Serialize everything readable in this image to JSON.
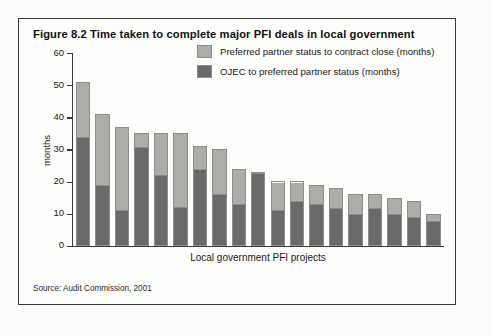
{
  "figure": {
    "title": "Figure 8.2 Time taken to complete major PFI deals in local government",
    "source": "Source: Audit Commission, 2001"
  },
  "legend": {
    "items": [
      {
        "label": "Preferred partner status to contract close (months)",
        "color": "#acaca8",
        "key": "preferred_to_close"
      },
      {
        "label": "OJEC to preferred partner status (months)",
        "color": "#6a6a6a",
        "key": "ojec_to_preferred"
      }
    ]
  },
  "axes": {
    "y_title": "months",
    "x_title": "Local government PFI projects",
    "y_ticks": [
      "0",
      "10",
      "20",
      "30",
      "40",
      "50",
      "60"
    ]
  },
  "chart_data": {
    "type": "bar",
    "title": "Figure 8.2 Time taken to complete major PFI deals in local government",
    "xlabel": "Local government PFI projects",
    "ylabel": "months",
    "ylim": [
      0,
      60
    ],
    "ytick_step": 10,
    "stacked": true,
    "grid": false,
    "legend_position": "top-right-inside",
    "categories": [
      "1",
      "2",
      "3",
      "4",
      "5",
      "6",
      "7",
      "8",
      "9",
      "10",
      "11",
      "12",
      "13",
      "14",
      "15",
      "16",
      "17",
      "18",
      "19"
    ],
    "series": [
      {
        "name": "OJEC to preferred partner status (months)",
        "color": "#6a6a6a",
        "values": [
          34,
          19,
          11,
          31,
          22,
          12,
          24,
          16,
          13,
          23,
          11,
          14,
          13,
          12,
          10,
          12,
          10,
          9,
          8
        ]
      },
      {
        "name": "Preferred partner status to contract close (months)",
        "color": "#acaca8",
        "values": [
          17,
          22,
          26,
          4,
          13,
          23,
          7,
          14,
          11,
          0,
          9,
          6,
          6,
          6,
          6,
          4,
          5,
          5,
          2
        ]
      }
    ],
    "totals": [
      51,
      41,
      37,
      35,
      35,
      35,
      31,
      30,
      24,
      23,
      20,
      20,
      19,
      18,
      16,
      16,
      15,
      14,
      10
    ]
  }
}
